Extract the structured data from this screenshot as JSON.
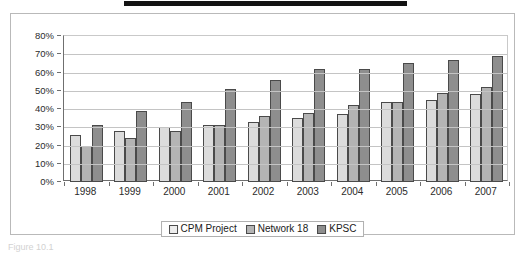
{
  "redaction": {
    "name": "black-redaction-bar"
  },
  "caption": {
    "text": "Figure 10.1"
  },
  "legend": {
    "position": "bottom-center",
    "entries": [
      {
        "label": "CPM Project",
        "color": "#ededed"
      },
      {
        "label": "Network 18",
        "color": "#b4b4b4"
      },
      {
        "label": "KPSC",
        "color": "#8e8e8e"
      }
    ]
  },
  "chart_data": {
    "type": "bar",
    "title": "",
    "xlabel": "",
    "ylabel": "",
    "ylim": [
      0,
      80
    ],
    "ytick_step": 10,
    "ytick_labels": [
      "80%",
      "70%",
      "60%",
      "50%",
      "40%",
      "30%",
      "20%",
      "10%",
      "0%"
    ],
    "grid": true,
    "grid_axis": "y",
    "legend_position": "bottom-center",
    "categories": [
      "1998",
      "1999",
      "2000",
      "2001",
      "2002",
      "2003",
      "2004",
      "2005",
      "2006",
      "2007"
    ],
    "series": [
      {
        "name": "CPM Project",
        "color": "#dcdcdc",
        "values": [
          26,
          28,
          30,
          31,
          33,
          35,
          37,
          44,
          45,
          48
        ]
      },
      {
        "name": "Network 18",
        "color": "#b4b4b4",
        "values": [
          20,
          24,
          28,
          31,
          36,
          38,
          42,
          44,
          49,
          52
        ]
      },
      {
        "name": "KPSC",
        "color": "#8e8e8e",
        "values": [
          31,
          39,
          44,
          51,
          56,
          62,
          62,
          65,
          67,
          69
        ]
      }
    ]
  }
}
